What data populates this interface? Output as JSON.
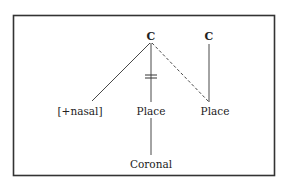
{
  "diagram": {
    "type": "autosegmental-phonology",
    "colors": {
      "background": "#ffffff",
      "frame": "#333333",
      "line": "#333333",
      "text": "#222222"
    },
    "nodes": {
      "c1": {
        "label": "C",
        "x": 151,
        "y": 40
      },
      "c2": {
        "label": "C",
        "x": 209,
        "y": 40
      },
      "nasal": {
        "label": "[+nasal]",
        "x": 80,
        "y": 115
      },
      "place1": {
        "label": "Place",
        "x": 151,
        "y": 115
      },
      "place2": {
        "label": "Place",
        "x": 215,
        "y": 115
      },
      "coronal": {
        "label": "Coronal",
        "x": 151,
        "y": 168
      }
    },
    "edges": [
      {
        "from": "c1",
        "to": "nasal",
        "style": "solid",
        "x1": 150,
        "y1": 43,
        "x2": 92,
        "y2": 101
      },
      {
        "from": "c1",
        "to": "place1",
        "style": "solid-delinked",
        "x1": 151,
        "y1": 43,
        "x2": 151,
        "y2": 102
      },
      {
        "from": "c1",
        "to": "place2",
        "style": "dashed",
        "x1": 152,
        "y1": 43,
        "x2": 209,
        "y2": 102
      },
      {
        "from": "c2",
        "to": "place2",
        "style": "solid",
        "x1": 209,
        "y1": 44,
        "x2": 209,
        "y2": 102
      },
      {
        "from": "place1",
        "to": "coronal",
        "style": "solid",
        "x1": 151,
        "y1": 118,
        "x2": 151,
        "y2": 155
      }
    ],
    "delink_mark": {
      "on_edge": "c1-place1",
      "glyph": "double-bar",
      "y": 76
    }
  }
}
